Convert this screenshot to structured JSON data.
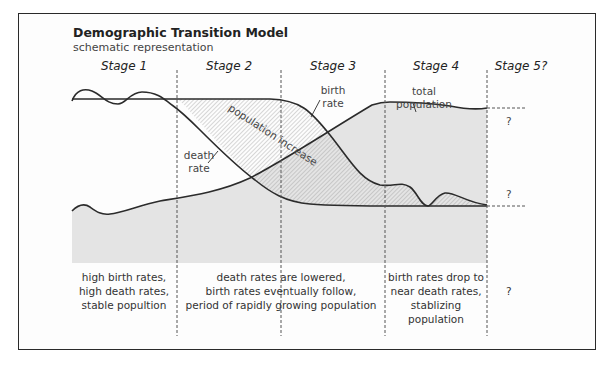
{
  "diagram": {
    "title": "Demographic Transition Model",
    "subtitle": "schematic representation",
    "stages": [
      {
        "label": "Stage 1",
        "caption": [
          "high birth rates,",
          "high death rates,",
          "stable popultion"
        ]
      },
      {
        "label": "Stage 2",
        "caption": []
      },
      {
        "label": "Stage 3",
        "caption": []
      },
      {
        "label": "Stage 4",
        "caption": [
          "birth rates drop to",
          "near death rates,",
          "stablizing",
          "population"
        ]
      },
      {
        "label": "Stage 5?",
        "caption": [
          "?"
        ]
      }
    ],
    "stage23_caption": [
      "death rates are lowered,",
      "birth rates eventually follow,",
      "period of rapidly growing population"
    ],
    "curve_labels": {
      "birth_rate": [
        "birth",
        "rate"
      ],
      "death_rate": [
        "death",
        "rate"
      ],
      "total_population": [
        "total",
        "population"
      ],
      "population_increase": "population increase"
    },
    "stage5_unknown_top": "?",
    "stage5_unknown_bottom": "?",
    "colors": {
      "frame": "#2a2a2a",
      "curve": "#2b2b2b",
      "population_fill": "#e4e4e4",
      "hatch": "#9a9a9a",
      "divider": "#555555"
    }
  }
}
